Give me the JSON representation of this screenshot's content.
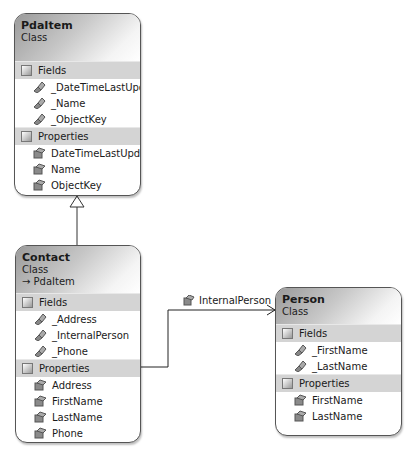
{
  "classes": {
    "pdaitem": {
      "name": "PdaItem",
      "kind": "Class",
      "fields_label": "Fields",
      "fields": [
        "_DateTimeLastUpd...",
        "_Name",
        "_ObjectKey"
      ],
      "properties_label": "Properties",
      "properties": [
        "DateTimeLastUpd...",
        "Name",
        "ObjectKey"
      ]
    },
    "contact": {
      "name": "Contact",
      "kind": "Class",
      "inherits": "→ PdaItem",
      "fields_label": "Fields",
      "fields": [
        "_Address",
        "_InternalPerson",
        "_Phone"
      ],
      "properties_label": "Properties",
      "properties": [
        "Address",
        "FirstName",
        "LastName",
        "Phone"
      ]
    },
    "person": {
      "name": "Person",
      "kind": "Class",
      "fields_label": "Fields",
      "fields": [
        "_FirstName",
        "_LastName"
      ],
      "properties_label": "Properties",
      "properties": [
        "FirstName",
        "LastName"
      ]
    }
  },
  "associations": [
    {
      "from": "Contact",
      "to": "Person",
      "label": "InternalPerson"
    }
  ],
  "inheritance": [
    {
      "child": "Contact",
      "parent": "PdaItem"
    }
  ]
}
